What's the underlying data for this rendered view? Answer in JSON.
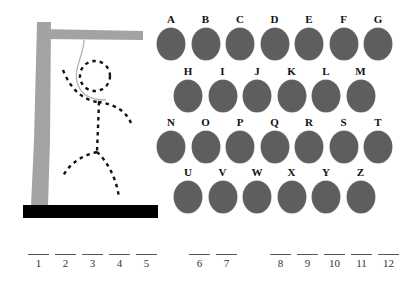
{
  "colors": {
    "gallows": "#a3a3a3",
    "base": "#000000",
    "figure": "#111111",
    "rope": "#b5b5b5",
    "letter_disc": "#5e5e5e"
  },
  "gallows": {
    "icons": [
      "gallows-icon",
      "rope-icon",
      "stick-figure-icon"
    ]
  },
  "letters": {
    "row1": [
      "A",
      "B",
      "C",
      "D",
      "E",
      "F",
      "G"
    ],
    "row2": [
      "H",
      "I",
      "J",
      "K",
      "L",
      "M"
    ],
    "row3": [
      "N",
      "O",
      "P",
      "Q",
      "R",
      "S",
      "T"
    ],
    "row4": [
      "U",
      "V",
      "W",
      "X",
      "Y",
      "Z"
    ]
  },
  "word": {
    "groups": [
      [
        "1",
        "2",
        "3",
        "4",
        "5"
      ],
      [
        "6",
        "7"
      ],
      [
        "8",
        "9",
        "10",
        "11",
        "12"
      ]
    ]
  }
}
